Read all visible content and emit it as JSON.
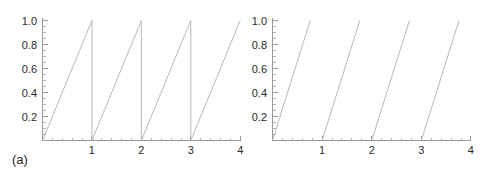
{
  "figure": {
    "background_color": "#ffffff",
    "line_color": "#b9b9b9",
    "axis_color": "#9a9a9a",
    "text_color": "#2b2b2b"
  },
  "panels": [
    {
      "caption": "(a)",
      "x_tick_labels": [
        "1",
        "2",
        "3",
        "4"
      ],
      "y_tick_labels": [
        "0.2",
        "0.4",
        "0.6",
        "0.8",
        "1.0"
      ]
    },
    {
      "caption": "(b)",
      "x_tick_labels": [
        "1",
        "2",
        "3",
        "4"
      ],
      "y_tick_labels": [
        "0.2",
        "0.4",
        "0.6",
        "0.8",
        "1.0"
      ]
    }
  ],
  "chart_data": [
    {
      "type": "line",
      "title": "",
      "subtitle": "",
      "xlabel": "",
      "ylabel": "",
      "xlim": [
        0,
        4
      ],
      "ylim": [
        0,
        1.0
      ],
      "xticks": [
        0,
        1,
        2,
        3,
        4
      ],
      "xticklabels": [
        "",
        "1",
        "2",
        "3",
        "4"
      ],
      "yticks": [
        0.2,
        0.4,
        0.6,
        0.8,
        1.0
      ],
      "yticklabels": [
        "0.2",
        "0.4",
        "0.6",
        "0.8",
        "1.0"
      ],
      "minor_ticks": true,
      "grid": false,
      "legend": false,
      "annotation": "(a)",
      "description": "Sawtooth wave of period 1 with unit amplitude; ramps rise linearly from 0 to 1 over each unit interval then drop vertically back to 0.",
      "series": [
        {
          "name": "sawtooth",
          "x": [
            0,
            1,
            1,
            2,
            2,
            3,
            3,
            4
          ],
          "y": [
            0,
            1,
            0,
            1,
            0,
            1,
            0,
            1
          ]
        }
      ],
      "segments": [
        {
          "x": [
            0,
            1
          ],
          "y": [
            0,
            1
          ]
        },
        {
          "x": [
            1,
            1
          ],
          "y": [
            1,
            0
          ]
        },
        {
          "x": [
            1,
            2
          ],
          "y": [
            0,
            1
          ]
        },
        {
          "x": [
            2,
            2
          ],
          "y": [
            1,
            0
          ]
        },
        {
          "x": [
            2,
            3
          ],
          "y": [
            0,
            1
          ]
        },
        {
          "x": [
            3,
            3
          ],
          "y": [
            1,
            0
          ]
        },
        {
          "x": [
            3,
            4
          ],
          "y": [
            0,
            1
          ]
        }
      ]
    },
    {
      "type": "line",
      "title": "",
      "subtitle": "",
      "xlabel": "",
      "ylabel": "",
      "xlim": [
        0,
        4
      ],
      "ylim": [
        0,
        1.0
      ],
      "xticks": [
        0,
        1,
        2,
        3,
        4
      ],
      "xticklabels": [
        "",
        "1",
        "2",
        "3",
        "4"
      ],
      "yticks": [
        0.2,
        0.4,
        0.6,
        0.8,
        1.0
      ],
      "yticklabels": [
        "0.2",
        "0.4",
        "0.6",
        "0.8",
        "1.0"
      ],
      "minor_ticks": true,
      "grid": false,
      "legend": false,
      "annotation": "(b)",
      "description": "Periodic ramps of period 1 with steeper slope; each ramp starts at 0 on an integer and reaches 1 after about 0.76 units, with no vertical return drawn.",
      "series": [
        {
          "name": "steep-ramp",
          "x": [
            0,
            0.76,
            1,
            1.76,
            2,
            2.76,
            3,
            3.76
          ],
          "y": [
            0,
            1,
            0,
            1,
            0,
            1,
            0,
            1
          ]
        }
      ],
      "segments": [
        {
          "x": [
            0,
            0.76
          ],
          "y": [
            0,
            1
          ]
        },
        {
          "x": [
            1,
            1.76
          ],
          "y": [
            0,
            1
          ]
        },
        {
          "x": [
            2,
            2.76
          ],
          "y": [
            0,
            1
          ]
        },
        {
          "x": [
            3,
            3.76
          ],
          "y": [
            0,
            1
          ]
        }
      ]
    }
  ]
}
